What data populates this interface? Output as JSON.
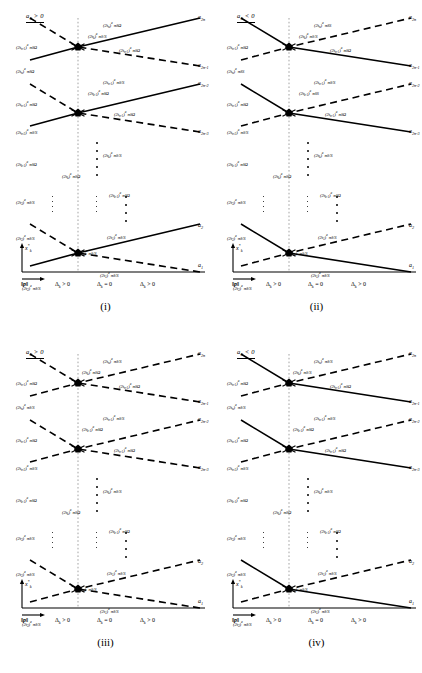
{
  "figure": {
    "width": 422,
    "height": 673,
    "ink": "#000000",
    "guide_color": "#999999"
  },
  "common": {
    "axis": {
      "y_label": "x*k",
      "y_label_base": "x",
      "y_label_sub": "k",
      "y_label_sup": "*",
      "x_label": "‖p‖",
      "regions": [
        {
          "delta": "Δ",
          "sub": "k",
          "rel": "> 0"
        },
        {
          "delta": "Δ",
          "sub": "k",
          "rel": "= 0"
        },
        {
          "delta": "Δ",
          "sub": "k",
          "rel": "> 0"
        }
      ]
    },
    "right_labels": [
      {
        "base": "a",
        "sub": "2n"
      },
      {
        "base": "a",
        "sub": "2n-1"
      },
      {
        "base": "a",
        "sub": "2n-2"
      },
      {
        "base": "a",
        "sub": "2n-3"
      },
      {
        "base": "a",
        "sub": "2"
      },
      {
        "base": "a",
        "sub": "1"
      }
    ]
  },
  "panels": [
    {
      "id": "i",
      "name": "(i)",
      "condition": {
        "var": "a",
        "sub": "0",
        "rel": "> 0"
      },
      "line_styles": [
        "solid",
        "dashed"
      ],
      "labels": [
        {
          "text": "(2tk)a πδ/S",
          "disp": "(2t",
          "sub": "k",
          "sup": "a",
          "tail": "πδ/S",
          "x": 88,
          "y": 33
        },
        {
          "text": "(2tn-1 −1)a πδΩ",
          "disp": "(2t",
          "sub": "n-1",
          "sup": "a",
          "tail": "πδΩ",
          "x": 16,
          "y": 44
        },
        {
          "text": "(2tn −1)a πδΩ",
          "disp": "(2t",
          "sub": "n",
          "sup": "a",
          "tail": "πδΩ",
          "x": 103,
          "y": 22
        },
        {
          "text": "(2tn-1 −1)a πδΩ",
          "disp": "(2t",
          "sub": "n-1",
          "sup": "a",
          "tail": "πδΩ",
          "x": 119,
          "y": 47
        },
        {
          "text": "(2tn −1)a πδΩ",
          "disp": "(2t",
          "sub": "n",
          "sup": "a",
          "tail": "πδΩ",
          "x": 16,
          "y": 68
        },
        {
          "text": "(2tn-1)a πδ/S",
          "disp": "(2t",
          "sub": "n-1",
          "sup": "a",
          "tail": "πδ/S",
          "x": 103,
          "y": 79
        },
        {
          "text": "(2tk-1 −1)a πδΩ",
          "disp": "(2t",
          "sub": "k-1",
          "sup": "a",
          "tail": "πδΩ",
          "x": 88,
          "y": 90
        },
        {
          "text": "(2tn-1 −1)a πδΩ",
          "disp": "(2t",
          "sub": "n-1",
          "sup": "a",
          "tail": "πδΩ",
          "x": 16,
          "y": 101
        },
        {
          "text": "(2tn-1 −1)a πδΩ",
          "disp": "(2t",
          "sub": "n-1",
          "sup": "a",
          "tail": "πδΩ",
          "x": 114,
          "y": 111
        },
        {
          "text": "(2tn-2)a πδ/S",
          "disp": "(2t",
          "sub": "n-2",
          "sup": "a",
          "tail": "πδ/S",
          "x": 16,
          "y": 129
        },
        {
          "text": "(2tk-1 −1)a πδΩ",
          "disp": "(2t",
          "sub": "k-1",
          "sup": "a",
          "tail": "πδΩ",
          "x": 16,
          "y": 161
        },
        {
          "text": "(2tk)a πδ/S",
          "disp": "(2t",
          "sub": "k",
          "sup": "a",
          "tail": "πδ/S",
          "x": 103,
          "y": 152
        },
        {
          "text": "(2tk −1)a πδΩ",
          "disp": "(2t",
          "sub": "k",
          "sup": "a",
          "tail": "πδΩ",
          "x": 62,
          "y": 173
        },
        {
          "text": "(2tk-1 −1)a πδΩ",
          "disp": "(2t",
          "sub": "k-1",
          "sup": "a",
          "tail": "πδΩ",
          "x": 109,
          "y": 192
        },
        {
          "text": "(2t3)a πδ/S",
          "disp": "(2t",
          "sub": "3",
          "sup": "a",
          "tail": "πδ/S",
          "x": 16,
          "y": 199
        },
        {
          "text": "(2t2)a πδ/S",
          "disp": "(2t",
          "sub": "2",
          "sup": "a",
          "tail": "πδ/S",
          "x": 16,
          "y": 235
        },
        {
          "text": "(2t1)a πδ/S",
          "disp": "(2t",
          "sub": "1",
          "sup": "a",
          "tail": "πδ/S",
          "x": 107,
          "y": 234
        },
        {
          "text": "(2tk)a πδ/S",
          "disp": "(2t",
          "sub": "k",
          "sup": "a",
          "tail": "πδ/S",
          "x": 78,
          "y": 250
        },
        {
          "text": "(2t1)a πδ/S",
          "disp": "(2t",
          "sub": "1",
          "sup": "a",
          "tail": "πδ/S",
          "x": 100,
          "y": 272
        },
        {
          "text": "(2t2)a πδ/S",
          "disp": "(2t",
          "sub": "2",
          "sup": "a",
          "tail": "πδ/S",
          "x": 22,
          "y": 285
        }
      ]
    },
    {
      "id": "ii",
      "name": "(ii)",
      "condition": {
        "var": "a",
        "sub": "0",
        "rel": "< 0"
      },
      "line_styles": [
        "dashed",
        "solid"
      ],
      "labels": [
        {
          "disp": "(2t",
          "sub": "k",
          "sup": "a",
          "tail": "πδ/S",
          "x": 88,
          "y": 33
        },
        {
          "disp": "(2t",
          "sub": "n-1",
          "sup": "a",
          "tail": "πδΩ",
          "x": 16,
          "y": 44
        },
        {
          "disp": "(2t",
          "sub": "n",
          "sup": "a",
          "tail": "πδS",
          "x": 103,
          "y": 22
        },
        {
          "disp": "(2t",
          "sub": "n-1",
          "sup": "a",
          "tail": "πδΩ",
          "x": 119,
          "y": 47
        },
        {
          "disp": "(2t",
          "sub": "n",
          "sup": "a",
          "tail": "πδS",
          "x": 16,
          "y": 68
        },
        {
          "disp": "(2t",
          "sub": "n-1",
          "sup": "a",
          "tail": "πδ/S",
          "x": 103,
          "y": 79
        },
        {
          "disp": "(2t",
          "sub": "k-1",
          "sup": "a",
          "tail": "πδS",
          "x": 88,
          "y": 90
        },
        {
          "disp": "(2t",
          "sub": "n-1",
          "sup": "a",
          "tail": "πδΩ",
          "x": 16,
          "y": 101
        },
        {
          "disp": "(2t",
          "sub": "n-1",
          "sup": "a",
          "tail": "πδΩ",
          "x": 114,
          "y": 111
        },
        {
          "disp": "(2t",
          "sub": "n-2",
          "sup": "a",
          "tail": "πδ/S",
          "x": 16,
          "y": 129
        },
        {
          "disp": "(2t",
          "sub": "k-1",
          "sup": "a",
          "tail": "πδΩ",
          "x": 16,
          "y": 161
        },
        {
          "disp": "(2t",
          "sub": "k",
          "sup": "a",
          "tail": "πδ/S",
          "x": 103,
          "y": 152
        },
        {
          "disp": "(2t",
          "sub": "k",
          "sup": "a",
          "tail": "πδΩ",
          "x": 62,
          "y": 173
        },
        {
          "disp": "(2t",
          "sub": "k-1",
          "sup": "a",
          "tail": "πδΩ",
          "x": 109,
          "y": 192
        },
        {
          "disp": "(2t",
          "sub": "3",
          "sup": "a",
          "tail": "πδ/S",
          "x": 16,
          "y": 199
        },
        {
          "disp": "(2t",
          "sub": "2",
          "sup": "a",
          "tail": "πδ/S",
          "x": 16,
          "y": 235
        },
        {
          "disp": "(2t",
          "sub": "1",
          "sup": "a",
          "tail": "πδ/S",
          "x": 107,
          "y": 234
        },
        {
          "disp": "(2t",
          "sub": "k",
          "sup": "a",
          "tail": "πδ/S",
          "x": 78,
          "y": 250
        },
        {
          "disp": "(2t",
          "sub": "1",
          "sup": "a",
          "tail": "πδ/S",
          "x": 100,
          "y": 272
        },
        {
          "disp": "(2t",
          "sub": "2",
          "sup": "a",
          "tail": "πδ/S",
          "x": 22,
          "y": 285
        }
      ]
    },
    {
      "id": "iii",
      "name": "(iii)",
      "condition": {
        "var": "a",
        "sub": "0",
        "rel": "> 0"
      },
      "line_styles": [
        "dashed",
        "dashed"
      ],
      "labels": [
        {
          "disp": "(2t",
          "sub": "k",
          "sup": "a",
          "tail": "πδΩ",
          "x": 82,
          "y": 33
        },
        {
          "disp": "(2t",
          "sub": "n-1",
          "sup": "a",
          "tail": "πδΩ",
          "x": 16,
          "y": 44
        },
        {
          "disp": "(2t",
          "sub": "n",
          "sup": "a",
          "tail": "πδ/S",
          "x": 103,
          "y": 22
        },
        {
          "disp": "(2t",
          "sub": "n-1",
          "sup": "a",
          "tail": "πδΩ",
          "x": 119,
          "y": 47
        },
        {
          "disp": "(2t",
          "sub": "n",
          "sup": "a",
          "tail": "πδ/S",
          "x": 16,
          "y": 68
        },
        {
          "disp": "(2t",
          "sub": "n-1",
          "sup": "a",
          "tail": "πδ/S",
          "x": 103,
          "y": 79
        },
        {
          "disp": "(2t",
          "sub": "k-1",
          "sup": "a",
          "tail": "πδΩ",
          "x": 82,
          "y": 90
        },
        {
          "disp": "(2t",
          "sub": "n-1",
          "sup": "a",
          "tail": "πδΩ",
          "x": 16,
          "y": 101
        },
        {
          "disp": "(2t",
          "sub": "n-1",
          "sup": "a",
          "tail": "πδΩ",
          "x": 114,
          "y": 111
        },
        {
          "disp": "(2t",
          "sub": "n-2",
          "sup": "a",
          "tail": "πδ/S",
          "x": 16,
          "y": 129
        },
        {
          "disp": "(2t",
          "sub": "k-1",
          "sup": "a",
          "tail": "πδΩ",
          "x": 16,
          "y": 161
        },
        {
          "disp": "(2t",
          "sub": "k",
          "sup": "a",
          "tail": "πδ/S",
          "x": 103,
          "y": 152
        },
        {
          "disp": "(2t",
          "sub": "k",
          "sup": "a",
          "tail": "πδΩ",
          "x": 62,
          "y": 173
        },
        {
          "disp": "(2t",
          "sub": "k-1",
          "sup": "a",
          "tail": "πδΩ",
          "x": 109,
          "y": 192
        },
        {
          "disp": "(2t",
          "sub": "3",
          "sup": "a",
          "tail": "πδ/S",
          "x": 16,
          "y": 199
        },
        {
          "disp": "(2t",
          "sub": "2",
          "sup": "a",
          "tail": "πδ/S",
          "x": 16,
          "y": 235
        },
        {
          "disp": "(2t",
          "sub": "1",
          "sup": "a",
          "tail": "πδ/S",
          "x": 107,
          "y": 234
        },
        {
          "disp": "(2t",
          "sub": "k",
          "sup": "a",
          "tail": "πδ/S",
          "x": 78,
          "y": 250
        },
        {
          "disp": "(2t",
          "sub": "1",
          "sup": "a",
          "tail": "πδ/S",
          "x": 100,
          "y": 272
        },
        {
          "disp": "(2t",
          "sub": "2",
          "sup": "a",
          "tail": "πδ/S",
          "x": 22,
          "y": 285
        }
      ]
    },
    {
      "id": "iv",
      "name": "(iv)",
      "condition": {
        "var": "a",
        "sub": "0",
        "rel": "< 0"
      },
      "line_styles": [
        "dashed",
        "solid"
      ],
      "labels": [
        {
          "disp": "(2t",
          "sub": "k",
          "sup": "a",
          "tail": "πδ/S",
          "x": 82,
          "y": 33
        },
        {
          "disp": "(2t",
          "sub": "n-1",
          "sup": "a",
          "tail": "πδΩ",
          "x": 16,
          "y": 44
        },
        {
          "disp": "(2t",
          "sub": "n",
          "sup": "a",
          "tail": "πδ/S",
          "x": 103,
          "y": 22
        },
        {
          "disp": "(2t",
          "sub": "n-1",
          "sup": "a",
          "tail": "πδΩ",
          "x": 119,
          "y": 47
        },
        {
          "disp": "(2t",
          "sub": "n",
          "sup": "a",
          "tail": "πδ/S",
          "x": 16,
          "y": 68
        },
        {
          "disp": "(2t",
          "sub": "n-1",
          "sup": "a",
          "tail": "πδ/S",
          "x": 103,
          "y": 79
        },
        {
          "disp": "(2t",
          "sub": "k-1",
          "sup": "a",
          "tail": "πδΩ",
          "x": 82,
          "y": 90
        },
        {
          "disp": "(2t",
          "sub": "n-1",
          "sup": "a",
          "tail": "πδΩ",
          "x": 16,
          "y": 101
        },
        {
          "disp": "(2t",
          "sub": "n-1",
          "sup": "a",
          "tail": "πδΩ",
          "x": 114,
          "y": 111
        },
        {
          "disp": "(2t",
          "sub": "n-2",
          "sup": "a",
          "tail": "πδ/S",
          "x": 16,
          "y": 129
        },
        {
          "disp": "(2t",
          "sub": "k-1",
          "sup": "a",
          "tail": "πδΩ",
          "x": 16,
          "y": 161
        },
        {
          "disp": "(2t",
          "sub": "k",
          "sup": "a",
          "tail": "πδ/S",
          "x": 103,
          "y": 152
        },
        {
          "disp": "(2t",
          "sub": "k",
          "sup": "a",
          "tail": "πδΩ",
          "x": 62,
          "y": 173
        },
        {
          "disp": "(2t",
          "sub": "k-1",
          "sup": "a",
          "tail": "πδΩ",
          "x": 109,
          "y": 192
        },
        {
          "disp": "(2t",
          "sub": "3",
          "sup": "a",
          "tail": "πδ/S",
          "x": 16,
          "y": 199
        },
        {
          "disp": "(2t",
          "sub": "2",
          "sup": "a",
          "tail": "πδ/S",
          "x": 16,
          "y": 235
        },
        {
          "disp": "(2t",
          "sub": "1",
          "sup": "a",
          "tail": "πδ/S",
          "x": 107,
          "y": 234
        },
        {
          "disp": "(2t",
          "sub": "k",
          "sup": "a",
          "tail": "πδ/S",
          "x": 78,
          "y": 250
        },
        {
          "disp": "(2t",
          "sub": "1",
          "sup": "a",
          "tail": "πδ/S",
          "x": 100,
          "y": 272
        },
        {
          "disp": "(2t",
          "sub": "2",
          "sup": "a",
          "tail": "πδ/S",
          "x": 22,
          "y": 285
        }
      ]
    }
  ],
  "chart_data": {
    "type": "line",
    "title": "",
    "xlabel": "‖p‖",
    "ylabel": "x*k",
    "grid": false,
    "legend": "none",
    "note": "Four schematic panels (i)-(iv) of intersecting branch curves a_1..a_2n versus ||p||; a vertical dotted guide at Delta_k = 0 marks crossing nodes.",
    "guide_x": 0.43,
    "regions": [
      "Δk > 0",
      "Δk = 0",
      "Δk > 0"
    ],
    "series": [
      {
        "name": "a2n",
        "x": [
          0.1,
          0.43,
          1.0
        ],
        "y": [
          0.74,
          0.855,
          0.955
        ]
      },
      {
        "name": "a2n-1",
        "x": [
          0.1,
          0.43,
          1.0
        ],
        "y": [
          0.955,
          0.855,
          0.775
        ]
      },
      {
        "name": "a2n-2",
        "x": [
          0.1,
          0.43,
          1.0
        ],
        "y": [
          0.545,
          0.655,
          0.745
        ]
      },
      {
        "name": "a2n-3",
        "x": [
          0.1,
          0.43,
          1.0
        ],
        "y": [
          0.755,
          0.655,
          0.575
        ]
      },
      {
        "name": "a2",
        "x": [
          0.1,
          0.43,
          1.0
        ],
        "y": [
          0.105,
          0.215,
          0.305
        ]
      },
      {
        "name": "a1",
        "x": [
          0.1,
          0.43,
          1.0
        ],
        "y": [
          0.315,
          0.215,
          0.135
        ]
      }
    ],
    "nodes": [
      {
        "x": 0.43,
        "y": 0.855
      },
      {
        "x": 0.43,
        "y": 0.655
      },
      {
        "x": 0.43,
        "y": 0.215
      }
    ]
  }
}
